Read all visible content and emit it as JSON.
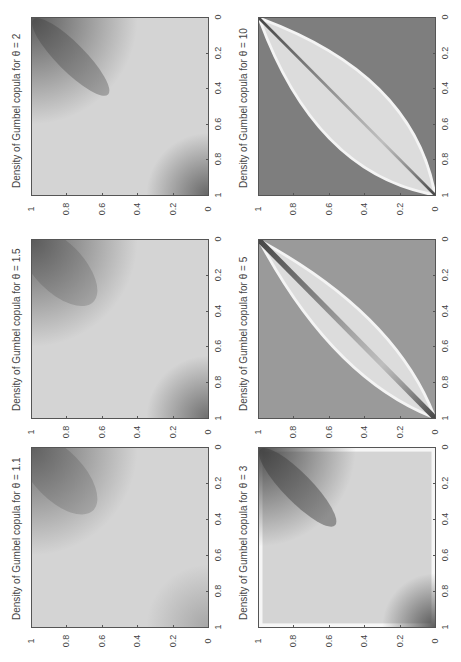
{
  "figure": {
    "orientation": "rotated 90 degrees counter-clockwise",
    "panels": [
      {
        "id": "p11",
        "title": "Density of Gumbel copula for θ = 1.1",
        "theta": 1.1
      },
      {
        "id": "p15",
        "title": "Density of Gumbel copula for θ = 1.5",
        "theta": 1.5
      },
      {
        "id": "p2",
        "title": "Density of Gumbel copula for θ = 2",
        "theta": 2
      },
      {
        "id": "p3",
        "title": "Density of Gumbel copula for θ = 3",
        "theta": 3
      },
      {
        "id": "p5",
        "title": "Density of Gumbel copula for θ = 5",
        "theta": 5
      },
      {
        "id": "p10",
        "title": "Density of Gumbel copula for θ = 10",
        "theta": 10
      }
    ],
    "tick_labels": [
      "0",
      "0.2",
      "0.4",
      "0.6",
      "0.8",
      "1"
    ]
  },
  "chart_data": [
    {
      "type": "heatmap",
      "title": "Density of Gumbel copula for θ = 1.1",
      "xlabel": "",
      "ylabel": "",
      "xlim": [
        0,
        1
      ],
      "ylim": [
        0,
        1
      ],
      "x_ticks": [
        0,
        0.2,
        0.4,
        0.6,
        0.8,
        1
      ],
      "y_ticks": [
        0,
        0.2,
        0.4,
        0.6,
        0.8,
        1
      ],
      "colormap": "grayscale (darker = higher density)",
      "description": "Nearly uniform light gray field with faint dark concentration at upper-tail corner (1,1) and slight darkening at (0,0)"
    },
    {
      "type": "heatmap",
      "title": "Density of Gumbel copula for θ = 1.5",
      "xlabel": "",
      "ylabel": "",
      "xlim": [
        0,
        1
      ],
      "ylim": [
        0,
        1
      ],
      "x_ticks": [
        0,
        0.2,
        0.4,
        0.6,
        0.8,
        1
      ],
      "y_ticks": [
        0,
        0.2,
        0.4,
        0.6,
        0.8,
        1
      ],
      "colormap": "grayscale (darker = higher density)",
      "description": "Dark elongated blob along diagonal near (1,1), mild darkening at (0,0)"
    },
    {
      "type": "heatmap",
      "title": "Density of Gumbel copula for θ = 2",
      "xlabel": "",
      "ylabel": "",
      "xlim": [
        0,
        1
      ],
      "ylim": [
        0,
        1
      ],
      "x_ticks": [
        0,
        0.2,
        0.4,
        0.6,
        0.8,
        1
      ],
      "y_ticks": [
        0,
        0.2,
        0.4,
        0.6,
        0.8,
        1
      ],
      "colormap": "grayscale (darker = higher density)",
      "description": "Stronger dark ridge along diagonal near (1,1) and dark spot at (0,0)"
    },
    {
      "type": "heatmap",
      "title": "Density of Gumbel copula for θ = 3",
      "xlabel": "",
      "ylabel": "",
      "xlim": [
        0,
        1
      ],
      "ylim": [
        0,
        1
      ],
      "x_ticks": [
        0,
        0.2,
        0.4,
        0.6,
        0.8,
        1
      ],
      "y_ticks": [
        0,
        0.2,
        0.4,
        0.6,
        0.8,
        1
      ],
      "colormap": "grayscale (darker = higher density)",
      "description": "Dark concentration along main diagonal at both ends; light bands near edges"
    },
    {
      "type": "heatmap",
      "title": "Density of Gumbel copula for θ = 5",
      "xlabel": "",
      "ylabel": "",
      "xlim": [
        0,
        1
      ],
      "ylim": [
        0,
        1
      ],
      "x_ticks": [
        0,
        0.2,
        0.4,
        0.6,
        0.8,
        1
      ],
      "y_ticks": [
        0,
        0.2,
        0.4,
        0.6,
        0.8,
        1
      ],
      "colormap": "grayscale (darker = higher density)",
      "description": "Narrow dark diagonal ridge, lens-shaped light region bounded by bright curves, dark off-diagonal corners"
    },
    {
      "type": "heatmap",
      "title": "Density of Gumbel copula for θ = 10",
      "xlabel": "",
      "ylabel": "",
      "xlim": [
        0,
        1
      ],
      "ylim": [
        0,
        1
      ],
      "x_ticks": [
        0,
        0.2,
        0.4,
        0.6,
        0.8,
        1
      ],
      "y_ticks": [
        0,
        0.2,
        0.4,
        0.6,
        0.8,
        1
      ],
      "colormap": "grayscale (darker = higher density)",
      "description": "Very thin dark diagonal line, pronounced bright lens-shaped boundary curves, dark gray off-diagonal corners"
    }
  ]
}
